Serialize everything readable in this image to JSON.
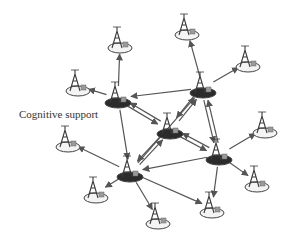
{
  "diagram": {
    "label": "Cognitive support",
    "label_pos": [
      19,
      108
    ],
    "colors": {
      "edge": "#555555",
      "hub_fill": "#2b2b2b",
      "node_fill": "#f4f4f4",
      "node_stroke": "#444444",
      "tower": "#3a3a3a",
      "box": "#9a9a9a"
    },
    "nodes": [
      {
        "id": "hub-a",
        "type": "hub",
        "x": 118,
        "y": 103
      },
      {
        "id": "hub-b",
        "type": "hub",
        "x": 203,
        "y": 93
      },
      {
        "id": "hub-c",
        "type": "hub",
        "x": 170,
        "y": 134
      },
      {
        "id": "hub-d",
        "type": "hub",
        "x": 219,
        "y": 160
      },
      {
        "id": "hub-e",
        "type": "hub",
        "x": 130,
        "y": 177
      },
      {
        "id": "n1",
        "type": "node",
        "x": 120,
        "y": 48
      },
      {
        "id": "n2",
        "type": "node",
        "x": 78,
        "y": 91
      },
      {
        "id": "n3",
        "type": "node",
        "x": 187,
        "y": 35
      },
      {
        "id": "n4",
        "type": "node",
        "x": 248,
        "y": 67
      },
      {
        "id": "n5",
        "type": "node",
        "x": 265,
        "y": 133
      },
      {
        "id": "n6",
        "type": "node",
        "x": 257,
        "y": 187
      },
      {
        "id": "n7",
        "type": "node",
        "x": 212,
        "y": 213
      },
      {
        "id": "n8",
        "type": "node",
        "x": 158,
        "y": 224
      },
      {
        "id": "n9",
        "type": "node",
        "x": 96,
        "y": 198
      },
      {
        "id": "n10",
        "type": "node",
        "x": 68,
        "y": 147
      }
    ],
    "edges": [
      {
        "from": "hub-a",
        "to": "n1"
      },
      {
        "from": "hub-a",
        "to": "n2"
      },
      {
        "from": "hub-b",
        "to": "hub-a"
      },
      {
        "from": "hub-c",
        "to": "hub-a"
      },
      {
        "from": "hub-a",
        "to": "hub-c"
      },
      {
        "from": "hub-b",
        "to": "n3"
      },
      {
        "from": "hub-b",
        "to": "n4"
      },
      {
        "from": "hub-b",
        "to": "hub-c"
      },
      {
        "from": "hub-c",
        "to": "hub-b"
      },
      {
        "from": "hub-d",
        "to": "hub-b"
      },
      {
        "from": "hub-b",
        "to": "hub-d"
      },
      {
        "from": "hub-e",
        "to": "hub-b"
      },
      {
        "from": "hub-d",
        "to": "hub-c"
      },
      {
        "from": "hub-c",
        "to": "hub-d"
      },
      {
        "from": "hub-d",
        "to": "n5"
      },
      {
        "from": "hub-d",
        "to": "n6"
      },
      {
        "from": "hub-d",
        "to": "n7"
      },
      {
        "from": "hub-d",
        "to": "hub-e"
      },
      {
        "from": "hub-e",
        "to": "hub-c"
      },
      {
        "from": "hub-c",
        "to": "hub-e"
      },
      {
        "from": "hub-e",
        "to": "n10"
      },
      {
        "from": "hub-e",
        "to": "n9"
      },
      {
        "from": "hub-e",
        "to": "n8"
      },
      {
        "from": "hub-e",
        "to": "n7"
      },
      {
        "from": "hub-a",
        "to": "hub-e"
      }
    ]
  }
}
